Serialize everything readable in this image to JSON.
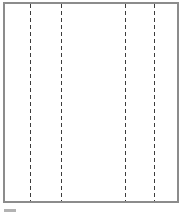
{
  "figure": {
    "canvas": {
      "width": 184,
      "height": 213,
      "background": "#ffffff"
    },
    "sheet": {
      "x": 3,
      "y": 2,
      "width": 176,
      "height": 201,
      "border_width": 2,
      "border_color": "#8c8c8c",
      "fill": "#ffffff"
    },
    "fold_lines": {
      "x_positions": [
        30,
        61,
        125,
        154
      ],
      "color": "#3c3c3c",
      "dash_length": 4,
      "gap_length": 3,
      "thickness": 1,
      "top": 4,
      "bottom": 201
    },
    "cropped_fragment": {
      "x": 4,
      "y": 209,
      "width": 12,
      "height": 3,
      "color": "#b3b3b3"
    }
  }
}
